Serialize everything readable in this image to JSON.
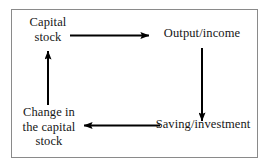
{
  "diagram": {
    "type": "cycle-flow-diagram",
    "border_color": "#8a8a8a",
    "arrow_color": "#000000",
    "text_color": "#161616",
    "background": "#ffffff",
    "nodes": [
      {
        "id": "capital-stock",
        "label": "Capital\nstock",
        "position": "top-left"
      },
      {
        "id": "output-income",
        "label": "Output/income",
        "position": "top-right"
      },
      {
        "id": "saving-investment",
        "label": "Saving/investment",
        "position": "bottom-right"
      },
      {
        "id": "change-in-capital-stock",
        "label": "Change in\nthe capital\nstock",
        "position": "bottom-left"
      }
    ],
    "arrows": [
      {
        "id": "capital-stock-to-output-income",
        "from": "capital-stock",
        "to": "output-income",
        "direction": "right"
      },
      {
        "id": "output-income-to-saving-investment",
        "from": "output-income",
        "to": "saving-investment",
        "direction": "down"
      },
      {
        "id": "saving-investment-to-change-in-capital-stock",
        "from": "saving-investment",
        "to": "change-in-capital-stock",
        "direction": "left"
      },
      {
        "id": "change-in-capital-stock-to-capital-stock",
        "from": "change-in-capital-stock",
        "to": "capital-stock",
        "direction": "up"
      }
    ]
  }
}
